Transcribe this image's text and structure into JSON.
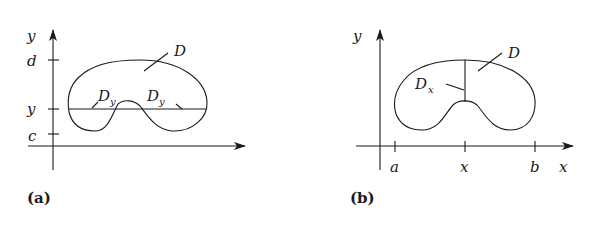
{
  "panels": [
    {
      "caption": "(a)",
      "axis_labels": {
        "y": "y"
      },
      "ticks": {
        "d": "d",
        "y": "y",
        "c": "c"
      },
      "region_label": "D",
      "slice_labels": [
        {
          "main": "D",
          "sub": "y"
        },
        {
          "main": "D",
          "sub": "y"
        }
      ]
    },
    {
      "caption": "(b)",
      "axis_labels": {
        "y": "y",
        "x": "x"
      },
      "ticks": {
        "a": "a",
        "x": "x",
        "b": "b"
      },
      "region_label": "D",
      "slice_labels": [
        {
          "main": "D",
          "sub": "x"
        }
      ]
    }
  ],
  "colors": {
    "ink": "#1a1a1a",
    "background": "#ffffff"
  }
}
